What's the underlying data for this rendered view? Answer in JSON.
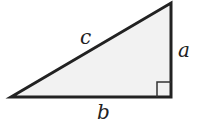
{
  "diagram": {
    "type": "right-triangle",
    "fill_color": "#f2f2f2",
    "stroke_color": "#222222",
    "vertices": {
      "bottom_left": [
        11,
        97
      ],
      "top_right": [
        171,
        3
      ],
      "bottom_right": [
        171,
        97
      ]
    },
    "right_angle_marker": true,
    "labels": {
      "hypotenuse": "c",
      "vertical_leg": "a",
      "horizontal_leg": "b"
    }
  }
}
